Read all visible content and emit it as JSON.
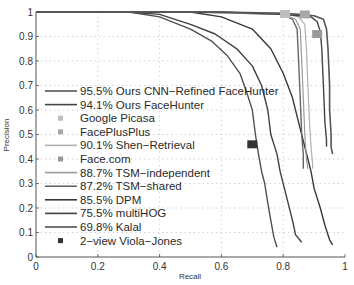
{
  "chart_data": {
    "type": "line",
    "title": "",
    "xlabel": "Recall",
    "ylabel": "Precision",
    "xlim": [
      0,
      1
    ],
    "ylim": [
      0,
      1
    ],
    "grid": true,
    "legend_position": "center-left",
    "xticks": [
      "0",
      "0.2",
      "0.4",
      "0.6",
      "0.8",
      "1"
    ],
    "yticks": [
      "0",
      "0.1",
      "0.2",
      "0.3",
      "0.4",
      "0.5",
      "0.6",
      "0.7",
      "0.8",
      "0.9",
      "1"
    ],
    "series": [
      {
        "name": "95.5% Ours CNN-Refined FaceHunter",
        "kind": "line",
        "color": "#555555",
        "width": 1.6,
        "points": [
          [
            0,
            1
          ],
          [
            0.3,
            1
          ],
          [
            0.6,
            1
          ],
          [
            0.8,
            0.995
          ],
          [
            0.85,
            0.99
          ],
          [
            0.9,
            0.985
          ],
          [
            0.93,
            0.97
          ],
          [
            0.94,
            0.93
          ],
          [
            0.945,
            0.85
          ],
          [
            0.95,
            0.7
          ],
          [
            0.95,
            0.6
          ],
          [
            0.955,
            0.5
          ],
          [
            0.955,
            0.45
          ],
          [
            0.96,
            0.42
          ]
        ]
      },
      {
        "name": "94.1% Ours FaceHunter",
        "kind": "line",
        "color": "#444444",
        "width": 1.4,
        "points": [
          [
            0,
            1
          ],
          [
            0.3,
            1
          ],
          [
            0.6,
            1
          ],
          [
            0.8,
            0.99
          ],
          [
            0.85,
            0.985
          ],
          [
            0.89,
            0.98
          ],
          [
            0.91,
            0.96
          ],
          [
            0.92,
            0.92
          ],
          [
            0.925,
            0.85
          ],
          [
            0.93,
            0.7
          ],
          [
            0.935,
            0.55
          ],
          [
            0.94,
            0.48
          ],
          [
            0.94,
            0.45
          ]
        ]
      },
      {
        "name": "Google Picasa",
        "kind": "marker",
        "color": "#bdbdbd",
        "points": [
          [
            0.806,
            0.992
          ]
        ]
      },
      {
        "name": "FacePlusPlus",
        "kind": "marker",
        "color": "#a8a8a8",
        "points": [
          [
            0.87,
            0.99
          ]
        ]
      },
      {
        "name": "90.1% Shen-Retrieval",
        "kind": "line",
        "color": "#b0b0b0",
        "width": 1.2,
        "points": [
          [
            0,
            1
          ],
          [
            0.5,
            1
          ],
          [
            0.8,
            0.995
          ],
          [
            0.85,
            0.98
          ],
          [
            0.87,
            0.95
          ],
          [
            0.875,
            0.85
          ],
          [
            0.88,
            0.7
          ],
          [
            0.885,
            0.55
          ],
          [
            0.89,
            0.45
          ],
          [
            0.895,
            0.38
          ],
          [
            0.895,
            0.36
          ]
        ]
      },
      {
        "name": "Face.com",
        "kind": "marker",
        "color": "#999999",
        "points": [
          [
            0.91,
            0.91
          ]
        ]
      },
      {
        "name": "88.7% TSM-independent",
        "kind": "line",
        "color": "#9a9a9a",
        "width": 1.2,
        "points": [
          [
            0,
            1
          ],
          [
            0.5,
            1
          ],
          [
            0.8,
            0.99
          ],
          [
            0.84,
            0.97
          ],
          [
            0.855,
            0.93
          ],
          [
            0.86,
            0.8
          ],
          [
            0.865,
            0.65
          ],
          [
            0.87,
            0.5
          ],
          [
            0.875,
            0.4
          ],
          [
            0.88,
            0.36
          ]
        ]
      },
      {
        "name": "87.2% TSM-shared",
        "kind": "line",
        "color": "#666666",
        "width": 1.4,
        "points": [
          [
            0,
            1
          ],
          [
            0.5,
            1
          ],
          [
            0.8,
            0.99
          ],
          [
            0.83,
            0.97
          ],
          [
            0.845,
            0.93
          ],
          [
            0.85,
            0.8
          ],
          [
            0.855,
            0.65
          ],
          [
            0.86,
            0.5
          ],
          [
            0.865,
            0.42
          ],
          [
            0.865,
            0.36
          ]
        ]
      },
      {
        "name": "85.5% DPM",
        "kind": "line",
        "color": "#383838",
        "width": 1.4,
        "points": [
          [
            0,
            1
          ],
          [
            0.5,
            1
          ],
          [
            0.6,
            0.98
          ],
          [
            0.7,
            0.93
          ],
          [
            0.76,
            0.85
          ],
          [
            0.8,
            0.75
          ],
          [
            0.83,
            0.65
          ],
          [
            0.85,
            0.55
          ],
          [
            0.87,
            0.45
          ],
          [
            0.88,
            0.4
          ],
          [
            0.89,
            0.35
          ],
          [
            0.9,
            0.28
          ],
          [
            0.92,
            0.2
          ],
          [
            0.935,
            0.13
          ],
          [
            0.95,
            0.07
          ],
          [
            0.96,
            0.05
          ]
        ]
      },
      {
        "name": "75.5% multiHOG",
        "kind": "line",
        "color": "#404040",
        "width": 1.4,
        "points": [
          [
            0.1,
            1
          ],
          [
            0.3,
            1
          ],
          [
            0.4,
            0.99
          ],
          [
            0.5,
            0.95
          ],
          [
            0.58,
            0.91
          ],
          [
            0.65,
            0.85
          ],
          [
            0.7,
            0.78
          ],
          [
            0.73,
            0.7
          ],
          [
            0.75,
            0.6
          ],
          [
            0.76,
            0.5
          ],
          [
            0.78,
            0.42
          ],
          [
            0.79,
            0.35
          ],
          [
            0.81,
            0.25
          ],
          [
            0.83,
            0.15
          ],
          [
            0.84,
            0.09
          ],
          [
            0.86,
            0.06
          ]
        ]
      },
      {
        "name": "69.8% Kalal",
        "kind": "line",
        "color": "#505050",
        "width": 1.4,
        "points": [
          [
            0.2,
            1
          ],
          [
            0.3,
            1
          ],
          [
            0.4,
            0.98
          ],
          [
            0.5,
            0.93
          ],
          [
            0.57,
            0.88
          ],
          [
            0.62,
            0.82
          ],
          [
            0.66,
            0.75
          ],
          [
            0.68,
            0.68
          ],
          [
            0.7,
            0.6
          ],
          [
            0.71,
            0.5
          ],
          [
            0.72,
            0.42
          ],
          [
            0.73,
            0.35
          ],
          [
            0.74,
            0.3
          ],
          [
            0.75,
            0.22
          ],
          [
            0.76,
            0.15
          ],
          [
            0.77,
            0.08
          ],
          [
            0.78,
            0.04
          ]
        ]
      },
      {
        "name": "2-view Viola-Jones",
        "kind": "marker",
        "color": "#333333",
        "points": [
          [
            0.7,
            0.46
          ]
        ]
      }
    ]
  },
  "axes": {
    "xlabel": "Recall",
    "ylabel": "Precision",
    "xticks": [
      "0",
      "0.2",
      "0.4",
      "0.6",
      "0.8",
      "1"
    ],
    "yticks": [
      "0",
      "0.1",
      "0.2",
      "0.3",
      "0.4",
      "0.5",
      "0.6",
      "0.7",
      "0.8",
      "0.9",
      "1"
    ]
  },
  "legend": {
    "items": [
      {
        "label": "95.5% Ours CNN−Refined FaceHunter",
        "type": "line",
        "color": "#555555"
      },
      {
        "label": "94.1% Ours FaceHunter",
        "type": "line",
        "color": "#444444"
      },
      {
        "label": "Google Picasa",
        "type": "marker",
        "color": "#bdbdbd"
      },
      {
        "label": "FacePlusPlus",
        "type": "marker",
        "color": "#a8a8a8"
      },
      {
        "label": "90.1% Shen−Retrieval",
        "type": "line",
        "color": "#b0b0b0"
      },
      {
        "label": "Face.com",
        "type": "marker",
        "color": "#999999"
      },
      {
        "label": "88.7% TSM−independent",
        "type": "line",
        "color": "#9a9a9a"
      },
      {
        "label": "87.2% TSM−shared",
        "type": "line",
        "color": "#666666"
      },
      {
        "label": "85.5% DPM",
        "type": "line",
        "color": "#383838"
      },
      {
        "label": "75.5% multiHOG",
        "type": "line",
        "color": "#404040"
      },
      {
        "label": "69.8% Kalal",
        "type": "line",
        "color": "#505050"
      },
      {
        "label": "2−view Viola−Jones",
        "type": "marker",
        "color": "#333333"
      }
    ]
  }
}
